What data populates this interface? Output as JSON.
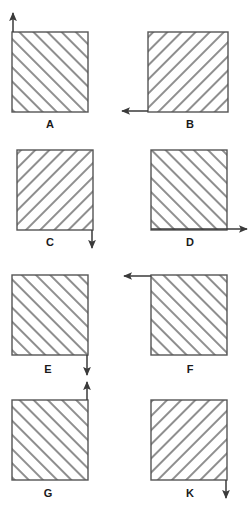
{
  "figure": {
    "colors": {
      "hatch": "#8f8f8f",
      "square_border": "#555555",
      "arrow": "#3a3a3a",
      "label": "#1a1a1a",
      "background": "#ffffff"
    },
    "hatch": {
      "spacing_px": 10,
      "line_width_px": 4,
      "angle_deg": 45
    },
    "panels": [
      {
        "id": "A",
        "label": "A",
        "square": {
          "x": 12,
          "y": 32,
          "w": 76,
          "h": 80
        },
        "hatch_direction": "forward-slash",
        "arrow": {
          "direction": "up",
          "anchor": "top-left-corner",
          "x1": 13,
          "y1": 32,
          "x2": 13,
          "y2": 13
        },
        "label_pos": {
          "x": 50,
          "y": 128
        }
      },
      {
        "id": "B",
        "label": "B",
        "square": {
          "x": 148,
          "y": 32,
          "w": 80,
          "h": 80
        },
        "hatch_direction": "back-slash",
        "arrow": {
          "direction": "left",
          "anchor": "bottom-left-corner",
          "x1": 148,
          "y1": 111,
          "x2": 122,
          "y2": 111
        },
        "label_pos": {
          "x": 190,
          "y": 128
        }
      },
      {
        "id": "C",
        "label": "C",
        "square": {
          "x": 17,
          "y": 150,
          "w": 76,
          "h": 80
        },
        "hatch_direction": "back-slash",
        "arrow": {
          "direction": "down",
          "anchor": "bottom-right-corner",
          "x1": 92,
          "y1": 230,
          "x2": 92,
          "y2": 248
        },
        "label_pos": {
          "x": 50,
          "y": 246
        }
      },
      {
        "id": "D",
        "label": "D",
        "square": {
          "x": 151,
          "y": 150,
          "w": 76,
          "h": 80
        },
        "hatch_direction": "forward-slash",
        "arrow": {
          "direction": "right",
          "anchor": "bottom-right-corner",
          "x1": 151,
          "y1": 229,
          "x2": 247,
          "y2": 229
        },
        "label_pos": {
          "x": 190,
          "y": 246
        }
      },
      {
        "id": "E",
        "label": "E",
        "square": {
          "x": 12,
          "y": 275,
          "w": 76,
          "h": 80
        },
        "hatch_direction": "forward-slash",
        "arrow": {
          "direction": "down",
          "anchor": "bottom-right-corner",
          "x1": 87,
          "y1": 355,
          "x2": 87,
          "y2": 375
        },
        "label_pos": {
          "x": 48,
          "y": 373
        }
      },
      {
        "id": "F",
        "label": "F",
        "square": {
          "x": 151,
          "y": 275,
          "w": 76,
          "h": 80
        },
        "hatch_direction": "forward-slash",
        "arrow": {
          "direction": "left",
          "anchor": "top-left-corner",
          "x1": 151,
          "y1": 276,
          "x2": 124,
          "y2": 276
        },
        "label_pos": {
          "x": 190,
          "y": 373
        }
      },
      {
        "id": "G",
        "label": "G",
        "square": {
          "x": 12,
          "y": 400,
          "w": 76,
          "h": 80
        },
        "hatch_direction": "forward-slash",
        "arrow": {
          "direction": "up",
          "anchor": "top-right-corner",
          "x1": 87,
          "y1": 400,
          "x2": 87,
          "y2": 382
        },
        "label_pos": {
          "x": 48,
          "y": 497
        }
      },
      {
        "id": "K",
        "label": "K",
        "square": {
          "x": 151,
          "y": 400,
          "w": 76,
          "h": 80
        },
        "hatch_direction": "back-slash",
        "arrow": {
          "direction": "down",
          "anchor": "bottom-right-corner",
          "x1": 226,
          "y1": 480,
          "x2": 226,
          "y2": 498
        },
        "label_pos": {
          "x": 190,
          "y": 497
        }
      }
    ]
  }
}
